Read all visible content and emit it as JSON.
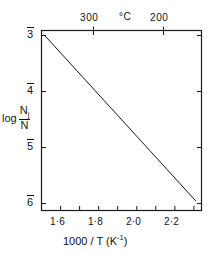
{
  "chart_data": {
    "type": "line",
    "title": "",
    "xlabel": "1000 / T (K⁻¹)",
    "ylabel": "log Nj/N",
    "ylabel_parts": {
      "prefix": "log",
      "numerator": "N",
      "numerator_sub": "j",
      "denominator": "N"
    },
    "xlim": [
      1.5,
      2.34
    ],
    "ylim": [
      -6.12,
      -2.92
    ],
    "grid": false,
    "legend": "none",
    "x_ticks": [
      1.6,
      1.8,
      2.0,
      2.2
    ],
    "x_tick_labels": [
      "1·6",
      "1·8",
      "2·0",
      "2·2"
    ],
    "x_minor_ticks": [
      1.5,
      1.7,
      1.9,
      2.1,
      2.3
    ],
    "y_ticks": [
      -3,
      -4,
      -5,
      -6
    ],
    "y_tick_labels": [
      "3",
      "4",
      "5",
      "6"
    ],
    "y_tick_label_style": "overbar-negative",
    "secondary_axis": {
      "position": "top",
      "label": "°C",
      "unit": "degC",
      "ticks": [
        300,
        200
      ],
      "tick_labels": [
        "300",
        "200"
      ],
      "tick_x_values": [
        1.745,
        2.114
      ]
    },
    "series": [
      {
        "name": "log(Nj/N) vs 1000/T",
        "type": "line",
        "x": [
          1.52,
          2.31
        ],
        "y": [
          -3.02,
          -5.95
        ],
        "color": "#1a1a1a",
        "linewidth": 1
      }
    ],
    "annotations": []
  },
  "axes": {
    "x_axis_label": "1000 / T (K⁻¹)",
    "x_axis_label_main": "1000 / T (K",
    "x_axis_label_exp": "-1",
    "x_axis_label_tail": ")",
    "top_axis_label": "°C"
  },
  "figure": {
    "frame_color": "#1a1a1a",
    "background": "#ffffff",
    "line_color": "#1a1a1a"
  }
}
